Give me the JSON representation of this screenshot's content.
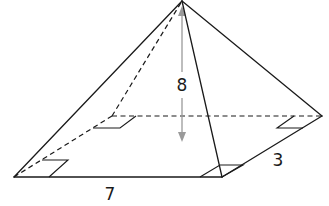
{
  "figure": {
    "type": "rectangular pyramid",
    "labels": {
      "height": "8",
      "length": "7",
      "width": "3"
    },
    "colors": {
      "edge": "#1a1a1a",
      "height_indicator": "#9a9a9a",
      "background": "#ffffff"
    }
  }
}
